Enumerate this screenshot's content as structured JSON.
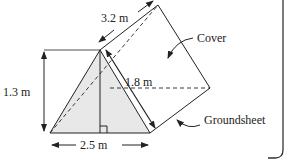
{
  "diagram": {
    "type": "triangular-prism-tent",
    "labels": {
      "length": "3.2 m",
      "height": "1.3 m",
      "slant": "1.8 m",
      "base": "2.5 m",
      "cover": "Cover",
      "groundsheet": "Groundsheet"
    },
    "colors": {
      "stroke": "#222222",
      "front_face_fill": "#e8e8e8",
      "background": "#ffffff",
      "frame": "#333333"
    }
  }
}
